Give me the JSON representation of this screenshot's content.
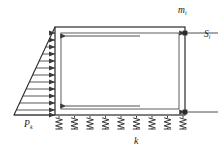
{
  "figure": {
    "background_color": "#ffffff",
    "line_color": "#2b2b2b",
    "arrow_color": "#3a3a3a"
  },
  "labels": {
    "mass": {
      "symbol": "m",
      "subscript": "i",
      "x": 178,
      "y": 6
    },
    "settlement": {
      "symbol": "S",
      "subscript": "i",
      "x": 204,
      "y": 30
    },
    "pressure": {
      "symbol": "P",
      "subscript": "k",
      "x": 24,
      "y": 120
    },
    "spring_stiffness": {
      "symbol": "k",
      "subscript": "",
      "x": 134,
      "y": 136
    }
  },
  "geometry": {
    "outer_frame": {
      "x": 55,
      "y": 27,
      "width": 130,
      "height": 88
    },
    "inner_frame": {
      "x": 61,
      "y": 33,
      "width": 118,
      "height": 76
    },
    "left_wall_x": 55,
    "right_wall_x": 185,
    "top_y": 27,
    "base_y": 115
  },
  "load": {
    "type": "triangular-distributed",
    "label": "P_k",
    "apex": {
      "x": 55,
      "y": 27
    },
    "base_left": {
      "x": 14,
      "y": 115
    },
    "base_right": {
      "x": 55,
      "y": 115
    },
    "arrow_count": 13,
    "direction": "rightward",
    "description": "Hydrostatic pressure increasing linearly with depth"
  },
  "springs": {
    "count": 9,
    "label": "k",
    "start_x": 59,
    "spacing": 15.5,
    "top_y": 116,
    "height": 13,
    "coil_turns": 4,
    "description": "Elastic Winkler foundation springs along base"
  },
  "internal_arrows": [
    {
      "name": "top-inertia-arrow",
      "x1": 140,
      "y1": 36,
      "x2": 66,
      "y2": 36,
      "direction": "left"
    },
    {
      "name": "bottom-inertia-arrow",
      "x1": 140,
      "y1": 106,
      "x2": 66,
      "y2": 106,
      "direction": "left"
    }
  ],
  "dimension_leaders": [
    {
      "name": "top-leader",
      "x1": 185,
      "y1": 33,
      "x2": 218,
      "y2": 33,
      "direction": "left"
    },
    {
      "name": "bottom-leader",
      "x1": 218,
      "y1": 112,
      "x2": 185,
      "y2": 112,
      "direction": "left"
    }
  ],
  "node_markers": [
    {
      "name": "top-right-node",
      "x": 185,
      "y": 33
    },
    {
      "name": "bottom-right-node",
      "x": 185,
      "y": 112
    }
  ]
}
